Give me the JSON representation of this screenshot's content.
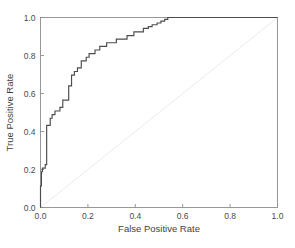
{
  "chart_data": {
    "type": "line",
    "title": "",
    "xlabel": "False Positive Rate",
    "ylabel": "True Positive Rate",
    "xlim": [
      0.0,
      1.0
    ],
    "ylim": [
      0.0,
      1.0
    ],
    "xticks": [
      "0.0",
      "0.2",
      "0.4",
      "0.6",
      "0.8",
      "1.0"
    ],
    "xtick_values": [
      0.0,
      0.2,
      0.4,
      0.6,
      0.8,
      1.0
    ],
    "yticks": [
      "0.0",
      "0.2",
      "0.4",
      "0.6",
      "0.8",
      "1.0"
    ],
    "ytick_values": [
      0.0,
      0.2,
      0.4,
      0.6,
      0.8,
      1.0
    ],
    "grid": false,
    "legend": null,
    "series": [
      {
        "name": "ROC curve",
        "color": "#4c4c4c",
        "points": [
          [
            0.0,
            0.0
          ],
          [
            0.0,
            0.113
          ],
          [
            0.004,
            0.113
          ],
          [
            0.004,
            0.188
          ],
          [
            0.008,
            0.188
          ],
          [
            0.008,
            0.207
          ],
          [
            0.02,
            0.207
          ],
          [
            0.02,
            0.226
          ],
          [
            0.026,
            0.226
          ],
          [
            0.026,
            0.432
          ],
          [
            0.041,
            0.432
          ],
          [
            0.041,
            0.47
          ],
          [
            0.049,
            0.47
          ],
          [
            0.049,
            0.489
          ],
          [
            0.061,
            0.489
          ],
          [
            0.061,
            0.508
          ],
          [
            0.082,
            0.508
          ],
          [
            0.082,
            0.527
          ],
          [
            0.094,
            0.527
          ],
          [
            0.094,
            0.565
          ],
          [
            0.119,
            0.565
          ],
          [
            0.119,
            0.64
          ],
          [
            0.131,
            0.64
          ],
          [
            0.131,
            0.697
          ],
          [
            0.143,
            0.697
          ],
          [
            0.143,
            0.716
          ],
          [
            0.156,
            0.716
          ],
          [
            0.156,
            0.735
          ],
          [
            0.172,
            0.735
          ],
          [
            0.172,
            0.772
          ],
          [
            0.193,
            0.772
          ],
          [
            0.193,
            0.791
          ],
          [
            0.205,
            0.791
          ],
          [
            0.205,
            0.81
          ],
          [
            0.23,
            0.81
          ],
          [
            0.23,
            0.829
          ],
          [
            0.25,
            0.829
          ],
          [
            0.25,
            0.848
          ],
          [
            0.279,
            0.848
          ],
          [
            0.279,
            0.867
          ],
          [
            0.32,
            0.867
          ],
          [
            0.32,
            0.886
          ],
          [
            0.365,
            0.886
          ],
          [
            0.365,
            0.905
          ],
          [
            0.394,
            0.905
          ],
          [
            0.394,
            0.924
          ],
          [
            0.434,
            0.924
          ],
          [
            0.434,
            0.943
          ],
          [
            0.455,
            0.943
          ],
          [
            0.455,
            0.952
          ],
          [
            0.471,
            0.952
          ],
          [
            0.471,
            0.962
          ],
          [
            0.492,
            0.962
          ],
          [
            0.492,
            0.971
          ],
          [
            0.508,
            0.971
          ],
          [
            0.508,
            0.981
          ],
          [
            0.524,
            0.981
          ],
          [
            0.524,
            0.99
          ],
          [
            0.537,
            0.99
          ],
          [
            0.537,
            1.0
          ],
          [
            0.553,
            1.0
          ],
          [
            1.0,
            1.0
          ]
        ]
      },
      {
        "name": "chance diagonal",
        "color": "#ececec",
        "points": [
          [
            0.0,
            0.0
          ],
          [
            1.0,
            1.0
          ]
        ]
      }
    ]
  },
  "caption": {
    "ghost_text": ""
  }
}
